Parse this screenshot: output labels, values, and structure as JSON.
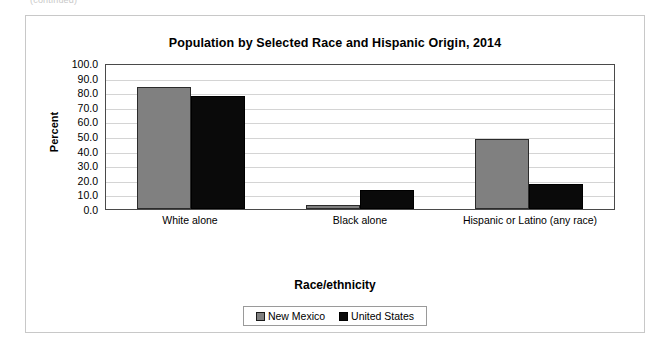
{
  "page": {
    "top_partial_text": "(continued)"
  },
  "legend": {
    "position": "bottom",
    "items": [
      {
        "label": "New Mexico",
        "color": "#808080",
        "icon": "square-swatch-gray"
      },
      {
        "label": "United States",
        "color": "#0a0a0a",
        "icon": "square-swatch-black"
      }
    ]
  },
  "chart_data": {
    "type": "bar",
    "title": "Population by Selected Race and Hispanic Origin, 2014",
    "xlabel": "Race/ethnicity",
    "ylabel": "Percent",
    "categories": [
      "White alone",
      "Black alone",
      "Hispanic or Latino (any race)"
    ],
    "series": [
      {
        "name": "New Mexico",
        "color": "#808080",
        "values": [
          83.4,
          2.5,
          47.7
        ]
      },
      {
        "name": "United States",
        "color": "#0a0a0a",
        "values": [
          77.4,
          13.2,
          17.4
        ]
      }
    ],
    "ylim": [
      0.0,
      100.0
    ],
    "ytick_step": 10.0,
    "yticks": [
      "100.0",
      "90.0",
      "80.0",
      "70.0",
      "60.0",
      "50.0",
      "40.0",
      "30.0",
      "20.0",
      "10.0",
      "0.0"
    ],
    "grid": true,
    "legend_position": "bottom"
  }
}
